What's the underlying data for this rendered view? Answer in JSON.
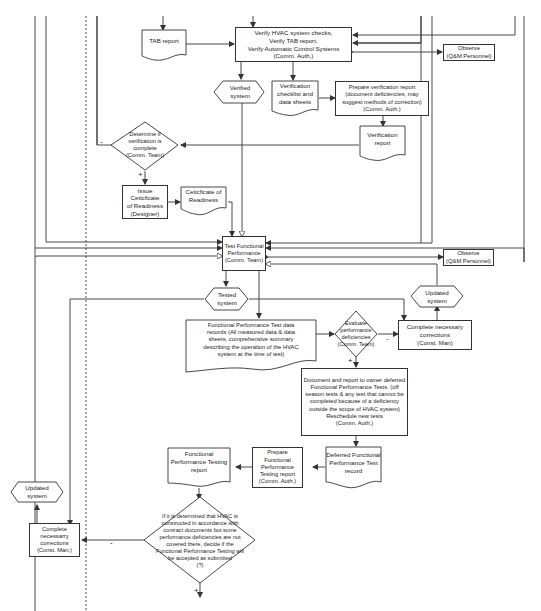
{
  "diagram": {
    "type": "flowchart",
    "title": "",
    "nodes": {
      "tab_report": {
        "shape": "document",
        "text": "TAB report"
      },
      "verify_hvac": {
        "shape": "process",
        "text": "Verify HVAC system checks,\nVerify TAB report,\nVerify Automatic Control Systems\n(Comm. Auth.)"
      },
      "observe_1": {
        "shape": "process",
        "text": "Observe\n(Q&M Personnel)"
      },
      "verified_system": {
        "shape": "hexagon",
        "text": "Verified\nsystem"
      },
      "verification_checklist": {
        "shape": "document",
        "text": "Verification\nchecklist and\ndata sheets"
      },
      "prepare_verification_report": {
        "shape": "process",
        "text": "Prepare verification report\n(document deficiencies, may\nsuggest methods of correction)\n(Comm. Auth.)"
      },
      "verification_report": {
        "shape": "document",
        "text": "Verification\nreport"
      },
      "determine_verification": {
        "shape": "decision",
        "text": "Determine if\nverification is\ncomplete\n(Comm. Team)"
      },
      "issue_certificate": {
        "shape": "process",
        "text": "Issue Ceticficate\nof Readiness\n(Designer)"
      },
      "certificate_readiness": {
        "shape": "document",
        "text": "Ceticficate of\nReadiness"
      },
      "test_functional": {
        "shape": "process",
        "text": "Test Functional\nPerformance\n(Comm. Team)"
      },
      "observe_2": {
        "shape": "process",
        "text": "Observe\n(Q&M Personnel)"
      },
      "tested_system": {
        "shape": "hexagon",
        "text": "Tested\nsystem"
      },
      "updated_system_right": {
        "shape": "hexagon",
        "text": "Updated\nsystem"
      },
      "fpt_data_records": {
        "shape": "document",
        "text": "Functional Performance Test data\nrecords (All measured data & data\nsheets, comprehensive summary\ndescribing the operation of the HVAC\nsystem at the time of test)"
      },
      "evaluate_deficiencies": {
        "shape": "decision",
        "text": "Evaluate\nperformance\ndeficiencies\n(Comm. Team)"
      },
      "complete_corrections_right": {
        "shape": "process",
        "text": "Complete necessary\ncorrections\n(Const. Man)"
      },
      "document_deferred": {
        "shape": "process",
        "text": "Document and report to owner deferred\nFunctional Performance Tests. (off\nseason tests & any test that cannot be\ncompleted because of a deficiency\noutside the scope of HVAC system)\nReschedule new tests\n(Comm. Auth.)"
      },
      "deferred_record": {
        "shape": "document",
        "text": "Deferred Functional\nPerformance Test\nrecord"
      },
      "prepare_fpt_report": {
        "shape": "process",
        "text": "Prepare\nFunctional\nPerformance\nTesting report\n(Comm. Auth.)"
      },
      "fpt_report": {
        "shape": "document",
        "text": "Functional\nPerformance Testing\nreport"
      },
      "decide_acceptance": {
        "shape": "decision",
        "text": "If it is determined that HVAC is\nconstructed in accordance with\ncontract documents but some\nperformance deficiencies are not\ncovered there, decide if the\nFunctional Performance Testing will\nbe accepted as submitted\n(?)"
      },
      "updated_system_left": {
        "shape": "hexagon",
        "text": "Updated\nsystem"
      },
      "complete_corrections_left": {
        "shape": "process",
        "text": "Complete\nnecessarry\ncorrections\n(Const. Man.)"
      }
    },
    "branch_labels": {
      "determine_no": "-",
      "determine_yes": "+",
      "evaluate_no": "-",
      "evaluate_yes": "+",
      "decide_no": "-",
      "decide_yes": "+"
    },
    "colors": {
      "line": "#333333",
      "background": "#ffffff",
      "text": "#222222"
    }
  }
}
